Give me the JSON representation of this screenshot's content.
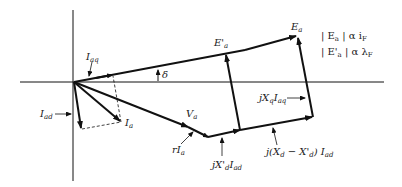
{
  "diagram": {
    "type": "phasor-diagram",
    "labels": {
      "Ea": "E",
      "Ea_sub": "a",
      "Ea_prime": "E'",
      "Ea_prime_sub": "a",
      "Iaq": "I",
      "Iaq_sub": "aq",
      "delta": "δ",
      "Iad": "I",
      "Iad_sub": "ad",
      "Ia": "I",
      "Ia_sub": "a",
      "Va": "V",
      "Va_sub": "a",
      "rIa": "rI",
      "rIa_sub": "a",
      "jXdp_Iad": "jX'",
      "jXdp_Iad_sub1": "d",
      "jXdp_Iad_I": "I",
      "jXdp_Iad_sub2": "ad",
      "jXq_Iaq": "jX",
      "jXq_Iaq_sub1": "q",
      "jXq_Iaq_I": "I",
      "jXq_Iaq_sub2": "aq",
      "jXd_diff": "j(X",
      "jXd_diff_sub1": "d",
      "jXd_diff_mid": " − X'",
      "jXd_diff_sub2": "d",
      "jXd_diff_end": ") I",
      "jXd_diff_sub3": "ad"
    },
    "relations": [
      {
        "lhs": "| E",
        "lhs_sub": "a",
        "rhs": " | α i",
        "rhs_sub": "F"
      },
      {
        "lhs": "| E'",
        "lhs_sub": "a",
        "rhs": " | α λ",
        "rhs_sub": "F"
      }
    ],
    "colors": {
      "stroke": "#111111",
      "text": "#222222",
      "background": "#ffffff"
    }
  }
}
